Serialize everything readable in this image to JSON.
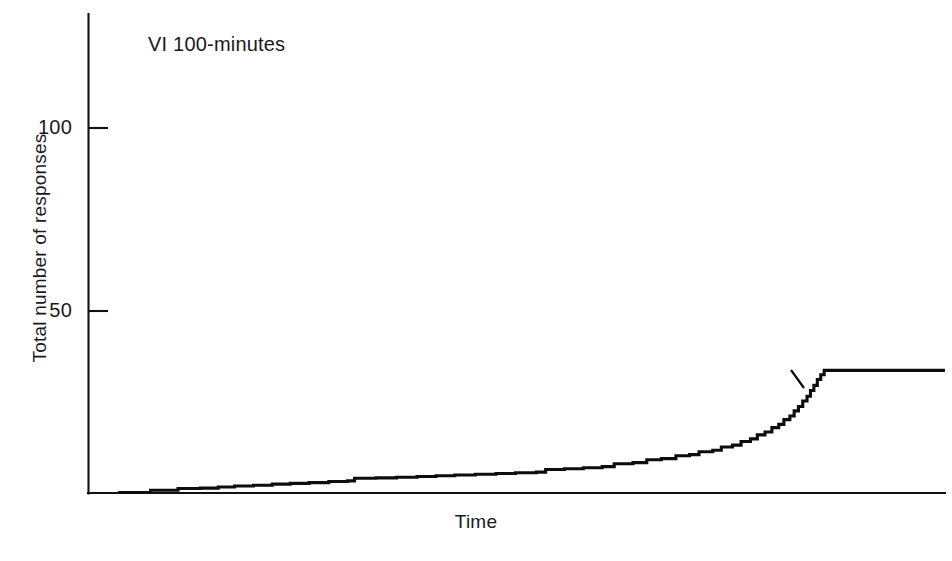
{
  "chart_data": {
    "type": "line",
    "title": "",
    "annotation": "VI 100-minutes",
    "xlabel": "Time",
    "ylabel": "Total number of responses",
    "grid": false,
    "legend": "none",
    "xlim": [
      0,
      1
    ],
    "ylim": [
      0,
      135
    ],
    "ytick_labels": [
      "100",
      "50"
    ],
    "ytick_values": [
      100,
      50
    ],
    "xtick_labels": [],
    "series": [
      {
        "name": "Cumulative responses",
        "description": "Cumulative record: positively accelerated staircase rising to a plateau after reinforcement",
        "final_value": 33.5,
        "reinforcement_pip_at": 33.5,
        "points_xy": [
          [
            0.035,
            0.0
          ],
          [
            0.072,
            0.0
          ],
          [
            0.073,
            0.6
          ],
          [
            0.104,
            0.6
          ],
          [
            0.105,
            1.1
          ],
          [
            0.131,
            1.2
          ],
          [
            0.152,
            1.5
          ],
          [
            0.171,
            1.8
          ],
          [
            0.193,
            2.0
          ],
          [
            0.215,
            2.3
          ],
          [
            0.236,
            2.5
          ],
          [
            0.258,
            2.7
          ],
          [
            0.281,
            3.0
          ],
          [
            0.303,
            3.2
          ],
          [
            0.311,
            3.9
          ],
          [
            0.336,
            4.0
          ],
          [
            0.36,
            4.2
          ],
          [
            0.384,
            4.4
          ],
          [
            0.406,
            4.6
          ],
          [
            0.428,
            4.8
          ],
          [
            0.452,
            5.0
          ],
          [
            0.476,
            5.2
          ],
          [
            0.499,
            5.4
          ],
          [
            0.523,
            5.6
          ],
          [
            0.534,
            6.3
          ],
          [
            0.556,
            6.5
          ],
          [
            0.578,
            6.8
          ],
          [
            0.6,
            7.1
          ],
          [
            0.614,
            7.9
          ],
          [
            0.636,
            8.2
          ],
          [
            0.652,
            9.0
          ],
          [
            0.669,
            9.3
          ],
          [
            0.686,
            10.1
          ],
          [
            0.702,
            10.4
          ],
          [
            0.713,
            11.2
          ],
          [
            0.729,
            11.6
          ],
          [
            0.739,
            12.5
          ],
          [
            0.752,
            13.0
          ],
          [
            0.762,
            14.0
          ],
          [
            0.773,
            14.7
          ],
          [
            0.781,
            15.8
          ],
          [
            0.79,
            16.6
          ],
          [
            0.798,
            17.8
          ],
          [
            0.806,
            18.7
          ],
          [
            0.812,
            20.0
          ],
          [
            0.819,
            21.0
          ],
          [
            0.824,
            22.4
          ],
          [
            0.829,
            23.6
          ],
          [
            0.834,
            25.1
          ],
          [
            0.839,
            26.4
          ],
          [
            0.843,
            28.0
          ],
          [
            0.847,
            29.4
          ],
          [
            0.851,
            31.0
          ],
          [
            0.855,
            32.3
          ],
          [
            0.859,
            33.5
          ],
          [
            1.0,
            33.5
          ]
        ]
      }
    ]
  },
  "axes": {
    "y_tick_100": "100",
    "y_tick_50": "50",
    "x_title": "Time",
    "y_title": "Total number of responses",
    "panel_annotation": "VI 100-minutes"
  },
  "colors": {
    "curve": "#0d0d0d",
    "axis": "#111111",
    "background": "#ffffff",
    "text": "#1a1a1a"
  }
}
